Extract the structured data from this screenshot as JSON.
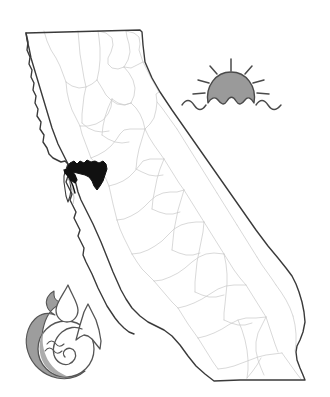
{
  "figure": {
    "background_color": "#ffffff",
    "width": 330,
    "height": 397
  },
  "colors": {
    "state_outline": "#3a3a3a",
    "county_line": "#c9c9c9",
    "delta_fill": "#111111",
    "icon_gray_fill": "#9a9a9a",
    "icon_outline": "#4a4a4a",
    "logo_gray_fill": "#9d9d9d",
    "logo_outline": "#555555",
    "page_background": "#ffffff"
  },
  "map": {
    "name": "california-state-map",
    "label": "California",
    "has_county_boundaries": true,
    "outline_width_px": 1.3,
    "county_line_width_px": 0.7,
    "bounds": {
      "x": 25,
      "y": 29,
      "width": 282,
      "height": 353
    }
  },
  "delta_highlight": {
    "name": "sacramento-san-joaquin-delta",
    "label": "Sacramento-San Joaquin Delta",
    "fill": "#111111",
    "bounds": {
      "x": 66,
      "y": 160,
      "width": 42,
      "height": 35
    }
  },
  "sun_icon": {
    "name": "sun-over-water-icon",
    "label": "Sun over water",
    "ray_count": 7,
    "dome_fill": "#9a9a9a",
    "outline": "#4a4a4a",
    "position": {
      "x": 182,
      "y": 58,
      "width": 100,
      "height": 62
    }
  },
  "logo": {
    "name": "water-environment-logo",
    "label": "Water and environment logo",
    "elements": [
      "water-droplet",
      "mountain-peak",
      "wave-spiral",
      "gray-flame-swoosh"
    ],
    "gray_fill": "#9d9d9d",
    "outline": "#555555",
    "position": {
      "x": 22,
      "y": 278,
      "width": 85,
      "height": 105
    }
  }
}
